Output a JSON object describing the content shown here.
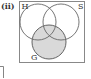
{
  "figure": {
    "label": "(ii)",
    "sets": [
      {
        "name": "H",
        "shaded": false
      },
      {
        "name": "S",
        "shaded": false
      },
      {
        "name": "G",
        "shaded": true
      }
    ],
    "colors": {
      "shade": "#d9d9d9",
      "stroke": "#555555",
      "frame": "#777777",
      "background": "#ffffff"
    }
  }
}
